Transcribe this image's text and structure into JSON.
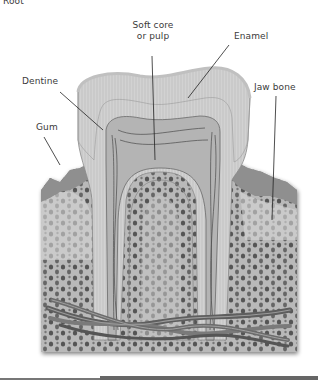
{
  "diagram": {
    "cutoff_heading": "Root",
    "labels": {
      "pulp_line1": "Soft core",
      "pulp_line2": "or pulp",
      "enamel": "Enamel",
      "dentine": "Dentine",
      "jaw_bone": "Jaw bone",
      "gum": "Gum"
    }
  },
  "colors": {
    "background": "#ffffff",
    "enamel": "#e6e6e6",
    "dentine": "#c9c9c9",
    "pulp": "#b4b4b4",
    "gum": "#8f8f8f",
    "bone": "#a8a8a8",
    "bone_pores": "#4a4a4a",
    "vessels": "#5a5a5a",
    "leader_lines": "#222222"
  }
}
